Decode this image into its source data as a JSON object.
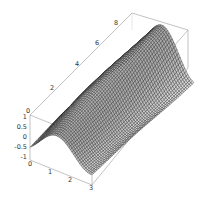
{
  "chart_data": {
    "type": "surface3d",
    "title": "",
    "xlabel": "",
    "ylabel": "",
    "zlabel": "",
    "x_ticks": [
      0,
      1,
      2,
      3
    ],
    "y_ticks": [
      0,
      2,
      4,
      6,
      8
    ],
    "z_ticks": [
      1,
      0.5,
      0,
      -0.5,
      -1
    ],
    "z_tick_labels": [
      "1",
      "0.5",
      "0",
      "-0.5",
      "-1"
    ],
    "xlim": [
      0,
      3
    ],
    "ylim": [
      0,
      9
    ],
    "zlim": [
      -1,
      1
    ],
    "grid": false,
    "box": true,
    "surface": "wavy mesh surface with ridge along y, peaks near y=9 at x~1 and x~3, trough near x~2 at low y",
    "mesh_color": "#1a1a1a",
    "face_color": "#d8d8d8",
    "box_color": "#9a9a9a"
  },
  "axes": {
    "x_labels": [
      "0",
      "1",
      "2",
      "3"
    ],
    "y_labels": [
      "0",
      "2",
      "4",
      "6",
      "8"
    ],
    "z_labels": [
      "1",
      "0.5",
      "0",
      "-0.5",
      "-1"
    ]
  }
}
